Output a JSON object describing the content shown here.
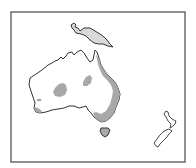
{
  "map": {
    "description": "Outline map of Australia, New Guinea, Tasmania and New Zealand with grey shaded regions",
    "colors": {
      "background": "#ffffff",
      "frame": "#555555",
      "coastline": "#333333",
      "land": "#ffffff",
      "shaded": "#a8a8a8",
      "new_guinea_fill": "#d9d9d9"
    },
    "regions": [
      {
        "name": "New Guinea",
        "shaded": true
      },
      {
        "name": "Australia",
        "shaded": false
      },
      {
        "name": "Tasmania",
        "shaded": true
      },
      {
        "name": "New Zealand North Island",
        "shaded": false
      },
      {
        "name": "New Zealand South Island",
        "shaded": false
      }
    ],
    "shaded_areas": [
      "Eastern Australian coast (Queensland to Victoria)",
      "Central-west Australia patch",
      "Central-north Australia patch",
      "Southwest Australia tip",
      "Small western patch"
    ]
  }
}
